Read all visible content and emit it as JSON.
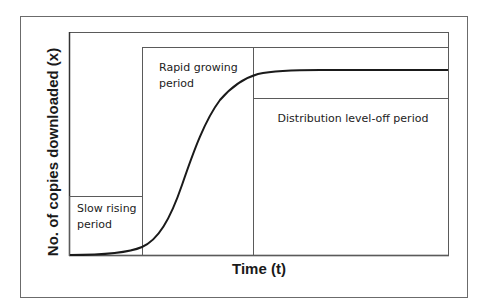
{
  "diagram": {
    "type": "s-curve-phases",
    "x_axis_label": "Time (t)",
    "y_axis_label": "No. of copies downloaded (x)",
    "phases": [
      {
        "id": "slow",
        "label_line1": "Slow rising",
        "label_line2": "period"
      },
      {
        "id": "rapid",
        "label_line1": "Rapid growing",
        "label_line2": "period"
      },
      {
        "id": "leveloff",
        "label_line1": "Distribution level-off period"
      }
    ],
    "colors": {
      "frame": "#6b6b6b",
      "box": "#5a5a5a",
      "curve": "#1a1a1a",
      "background": "#ffffff"
    }
  }
}
